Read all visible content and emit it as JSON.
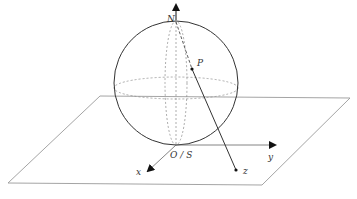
{
  "diagram": {
    "type": "stereographic-projection",
    "labels": {
      "north": "N",
      "origin": "O / S",
      "point_sphere": "P",
      "point_plane": "z",
      "x_axis": "x",
      "y_axis": "y"
    },
    "colors": {
      "stroke": "#333333",
      "plane": "#9a9a9a",
      "dashed": "#8a8a8a",
      "background": "#ffffff"
    }
  }
}
